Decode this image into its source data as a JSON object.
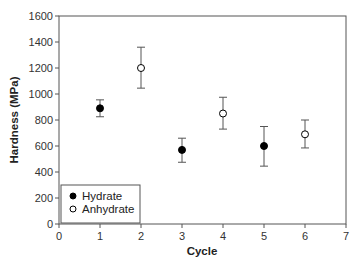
{
  "chart_data": {
    "type": "scatter",
    "title": "",
    "xlabel": "Cycle",
    "ylabel": "Hardness (MPa)",
    "xlim": [
      0,
      7
    ],
    "ylim": [
      0,
      1600
    ],
    "xticks": [
      0,
      1,
      2,
      3,
      4,
      5,
      6,
      7
    ],
    "yticks": [
      0,
      200,
      400,
      600,
      800,
      1000,
      1200,
      1400,
      1600
    ],
    "grid": false,
    "legend_position": "lower-left",
    "series": [
      {
        "name": "Hydrate",
        "marker": "filled-circle",
        "color": "#000000",
        "x": [
          1,
          3,
          5
        ],
        "y": [
          890,
          570,
          600
        ],
        "err_lower": [
          65,
          95,
          155
        ],
        "err_upper": [
          65,
          90,
          150
        ]
      },
      {
        "name": "Anhydrate",
        "marker": "open-circle",
        "color": "#000000",
        "x": [
          2,
          4,
          6
        ],
        "y": [
          1200,
          850,
          690
        ],
        "err_lower": [
          155,
          120,
          105
        ],
        "err_upper": [
          160,
          125,
          110
        ]
      }
    ]
  }
}
